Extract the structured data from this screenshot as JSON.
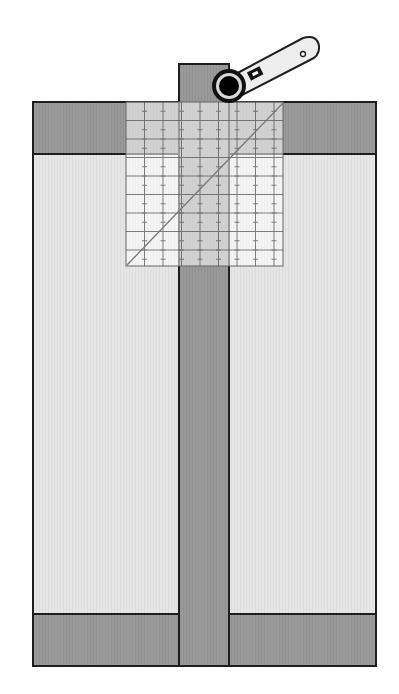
{
  "diagram": {
    "colors": {
      "background": "#ffffff",
      "dark_fabric": "#9a9a9a",
      "light_fabric": "#e6e6e6",
      "outline": "#1e1e1e",
      "ruler_fill": "#ffffff",
      "ruler_opacity": 0.55,
      "ruler_grid": "#555555",
      "cutter_handle": "#eeeeee",
      "cutter_wheel": "#000000",
      "cutter_ring": "#d8d8d8"
    },
    "block": {
      "x": 33,
      "y": 102,
      "width": 343,
      "height": 564
    },
    "top_band": {
      "y": 102,
      "height": 52
    },
    "bottom_band": {
      "y": 614,
      "height": 52
    },
    "center_strip": {
      "x": 179,
      "width": 50,
      "top": 64,
      "bottom": 666
    },
    "ruler": {
      "x": 126,
      "y": 102,
      "width": 157,
      "height": 164,
      "grid_step": 18.5
    },
    "rotary_cutter": {
      "wheel_cx": 229,
      "wheel_cy": 86,
      "wheel_r": 17,
      "handle_end_x": 310,
      "handle_end_y": 47
    }
  }
}
